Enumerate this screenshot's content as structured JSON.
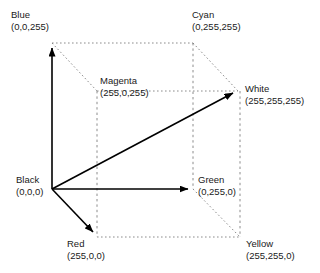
{
  "diagram": {
    "type": "rgb-color-cube",
    "background_color": "#ffffff",
    "solid_line_color": "#000000",
    "dotted_line_color": "#808080",
    "text_color": "#1a1a1a"
  },
  "vertices": {
    "blue": {
      "name": "Blue",
      "coords": "(0,0,255)",
      "x": 52,
      "y": 43
    },
    "cyan": {
      "name": "Cyan",
      "coords": "(0,255,255)",
      "x": 193,
      "y": 43
    },
    "magenta": {
      "name": "Magenta",
      "coords": "(255,0,255)",
      "x": 97,
      "y": 91
    },
    "white": {
      "name": "White",
      "coords": "(255,255,255)",
      "x": 238,
      "y": 91
    },
    "black": {
      "name": "Black",
      "coords": "(0,0,0)",
      "x": 52,
      "y": 189
    },
    "green": {
      "name": "Green",
      "coords": "(0,255,0)",
      "x": 193,
      "y": 189
    },
    "red": {
      "name": "Red",
      "coords": "(255,0,0)",
      "x": 97,
      "y": 237
    },
    "yellow": {
      "name": "Yellow",
      "coords": "(255,255,0)",
      "x": 240,
      "y": 237
    }
  },
  "axes": [
    {
      "name": "blue-axis",
      "from": "black",
      "to": "blue",
      "style": "solid-arrow"
    },
    {
      "name": "green-axis",
      "from": "black",
      "to": "green",
      "style": "solid-arrow"
    },
    {
      "name": "red-axis",
      "from": "black",
      "to": "red",
      "style": "solid-arrow"
    },
    {
      "name": "white-diagonal",
      "from": "black",
      "to": "white",
      "style": "solid-arrow"
    }
  ],
  "edges": [
    {
      "from": "blue",
      "to": "cyan",
      "style": "dotted"
    },
    {
      "from": "blue",
      "to": "magenta",
      "style": "dotted"
    },
    {
      "from": "cyan",
      "to": "white",
      "style": "dotted"
    },
    {
      "from": "cyan",
      "to": "green",
      "style": "dashed"
    },
    {
      "from": "magenta",
      "to": "white",
      "style": "dotted"
    },
    {
      "from": "magenta",
      "to": "red",
      "style": "dashed"
    },
    {
      "from": "white",
      "to": "yellow",
      "style": "dashed"
    },
    {
      "from": "green",
      "to": "yellow",
      "style": "dotted"
    },
    {
      "from": "red",
      "to": "yellow",
      "style": "dotted"
    }
  ]
}
